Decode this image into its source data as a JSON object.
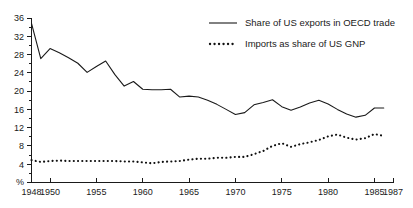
{
  "chart_data": {
    "type": "line",
    "title": "",
    "subtitle": "",
    "xlabel": "",
    "ylabel": "%",
    "unit_label": "%",
    "grid": false,
    "legend_position": "top-right",
    "xlim": [
      1948,
      1987
    ],
    "ylim": [
      0,
      36
    ],
    "y_ticks": [
      0,
      4,
      8,
      12,
      16,
      20,
      24,
      28,
      32,
      36
    ],
    "y_tick_labels": [
      "0",
      "4",
      "8",
      "12",
      "16",
      "20",
      "24",
      "28",
      "32",
      "36"
    ],
    "y_minor_tick_step": 2,
    "x_ticks": [
      1948,
      1950,
      1955,
      1960,
      1965,
      1970,
      1975,
      1980,
      1985,
      1987
    ],
    "x_tick_labels": [
      "1948",
      "1950",
      "1955",
      "1960",
      "1965",
      "1970",
      "1975",
      "1980",
      "1985",
      "1987"
    ],
    "x": [
      1948,
      1949,
      1950,
      1951,
      1952,
      1953,
      1954,
      1955,
      1956,
      1957,
      1958,
      1959,
      1960,
      1961,
      1962,
      1963,
      1964,
      1965,
      1966,
      1967,
      1968,
      1969,
      1970,
      1971,
      1972,
      1973,
      1974,
      1975,
      1976,
      1977,
      1978,
      1979,
      1980,
      1981,
      1982,
      1983,
      1984,
      1985,
      1986
    ],
    "series": [
      {
        "name": "Share of US exports in OECD trade",
        "style": "solid",
        "color": "#1a1a1a",
        "values": [
          34.8,
          27.1,
          29.3,
          28.4,
          27.3,
          26.1,
          24.1,
          25.4,
          26.6,
          23.6,
          21.1,
          22.1,
          20.4,
          20.3,
          20.3,
          20.4,
          18.7,
          18.9,
          18.7,
          18.0,
          17.1,
          16.0,
          14.9,
          15.3,
          17.0,
          17.5,
          18.1,
          16.6,
          15.8,
          16.5,
          17.4,
          18.0,
          17.2,
          16.0,
          15.0,
          14.3,
          14.7,
          16.3,
          16.3
        ]
      },
      {
        "name": "Imports as share of US GNP",
        "style": "dotted",
        "color": "#111111",
        "values": [
          4.9,
          4.5,
          4.7,
          4.8,
          4.7,
          4.7,
          4.7,
          4.7,
          4.7,
          4.7,
          4.6,
          4.6,
          4.4,
          4.2,
          4.5,
          4.6,
          4.7,
          5.0,
          5.2,
          5.2,
          5.4,
          5.4,
          5.6,
          5.6,
          6.2,
          6.9,
          8.0,
          8.6,
          7.8,
          8.4,
          8.8,
          9.3,
          10.1,
          10.5,
          9.8,
          9.4,
          9.7,
          10.6,
          10.2
        ]
      }
    ],
    "legend": [
      {
        "label": "Share of US exports in OECD trade",
        "style": "solid"
      },
      {
        "label": "Imports as share of US GNP",
        "style": "dotted"
      }
    ]
  }
}
